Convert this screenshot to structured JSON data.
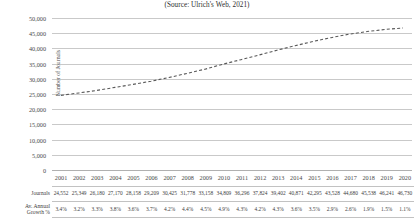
{
  "caption": "(Source: Ulrich's Web, 2021)",
  "axis": {
    "y_title": "Number of Journals",
    "y_ticks": [
      "50,000",
      "45,000",
      "40,000",
      "35,000",
      "30,000",
      "25,000",
      "20,000",
      "15,000",
      "10,000",
      "5,000",
      "0"
    ]
  },
  "table": {
    "row_label_journals": "Journals",
    "row_label_growth_line1": "Av. Annual",
    "row_label_growth_line2": "Growth %"
  },
  "colors": {
    "series_line": "#595959",
    "gridline": "#c9c9c9",
    "text": "#3d3d3d"
  },
  "chart_data": {
    "type": "line",
    "title": "(Source: Ulrich's Web, 2021)",
    "xlabel": "",
    "ylabel": "Number of Journals",
    "ylim": [
      0,
      50000
    ],
    "ytick_step": 5000,
    "grid": true,
    "legend": "none",
    "line_style": "dashed",
    "categories": [
      "2001",
      "2002",
      "2003",
      "2004",
      "2005",
      "2006",
      "2007",
      "2008",
      "2009",
      "2010",
      "2011",
      "2012",
      "2013",
      "2014",
      "2015",
      "2016",
      "2017",
      "2018",
      "2019",
      "2020"
    ],
    "series": [
      {
        "name": "Journals",
        "values": [
          24552,
          25349,
          26180,
          27170,
          28158,
          29209,
          30425,
          31778,
          33158,
          34809,
          36296,
          37824,
          39402,
          40871,
          42295,
          43528,
          44680,
          45538,
          46241,
          46730
        ]
      }
    ],
    "journals_formatted": [
      "24,552",
      "25,349",
      "26,180",
      "27,170",
      "28,158",
      "29,209",
      "30,425",
      "31,778",
      "33,158",
      "34,809",
      "36,296",
      "37,824",
      "39,402",
      "40,871",
      "42,295",
      "43,528",
      "44,680",
      "45,538",
      "46,241",
      "46,730"
    ],
    "growth_pct": [
      "3.4%",
      "3.2%",
      "3.3%",
      "3.8%",
      "3.6%",
      "3.7%",
      "4.2%",
      "4.4%",
      "4.5%",
      "4.9%",
      "4.3%",
      "4.2%",
      "4.3%",
      "3.6%",
      "3.5%",
      "2.9%",
      "2.6%",
      "1.9%",
      "1.5%",
      "1.1%"
    ]
  }
}
